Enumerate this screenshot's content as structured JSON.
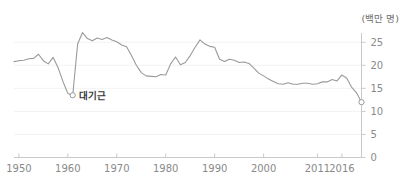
{
  "chart_data": {
    "type": "line",
    "title": "",
    "subtitle": "",
    "unit_label": "(백만 명)",
    "xlabel": "",
    "ylabel": "",
    "xlim": [
      1949,
      2020
    ],
    "ylim": [
      0,
      27
    ],
    "yticks": [
      0,
      5,
      10,
      15,
      20,
      25
    ],
    "ytick_labels": [
      "0",
      "5",
      "10",
      "15",
      "20",
      "25"
    ],
    "xticks": [
      1950,
      1960,
      1970,
      1980,
      1990,
      2011,
      2016
    ],
    "xtick_labels": [
      "1950",
      "1960",
      "1970",
      "1980",
      "1990",
      "2000",
      "2011",
      "2016"
    ],
    "xtick_values": [
      1950,
      1960,
      1970,
      1980,
      1990,
      2000,
      2011,
      2016
    ],
    "grid": true,
    "grid_axis": "y",
    "legend": "none",
    "line_color": "#9a9a9a",
    "axis_color": "#c9c9c9",
    "text_color": "#8a8a8a",
    "annotation_text_color": "#3a3a3a",
    "series": [
      {
        "name": "출생아 수",
        "x": [
          1949,
          1950,
          1951,
          1952,
          1953,
          1954,
          1955,
          1956,
          1957,
          1958,
          1959,
          1960,
          1961,
          1962,
          1963,
          1964,
          1965,
          1966,
          1967,
          1968,
          1969,
          1970,
          1971,
          1972,
          1973,
          1974,
          1975,
          1976,
          1977,
          1978,
          1979,
          1980,
          1981,
          1982,
          1983,
          1984,
          1985,
          1986,
          1987,
          1988,
          1989,
          1990,
          1991,
          1992,
          1993,
          1994,
          1995,
          1996,
          1997,
          1998,
          1999,
          2000,
          2001,
          2002,
          2003,
          2004,
          2005,
          2006,
          2007,
          2008,
          2009,
          2010,
          2011,
          2012,
          2013,
          2014,
          2015,
          2016,
          2017,
          2018,
          2019,
          2020
        ],
        "values": [
          20.8,
          21.0,
          21.1,
          21.4,
          21.5,
          22.4,
          21.0,
          20.3,
          21.7,
          19.5,
          16.5,
          13.9,
          13.5,
          24.6,
          27.1,
          25.8,
          25.3,
          25.9,
          25.6,
          26.0,
          25.5,
          25.1,
          24.4,
          24.0,
          22.1,
          20.0,
          18.4,
          17.7,
          17.6,
          17.5,
          18.0,
          17.9,
          20.3,
          21.8,
          20.1,
          20.6,
          22.1,
          23.9,
          25.5,
          24.6,
          24.1,
          23.9,
          21.3,
          20.8,
          21.3,
          21.1,
          20.6,
          20.7,
          20.4,
          19.4,
          18.3,
          17.7,
          17.0,
          16.5,
          16.0,
          15.9,
          16.2,
          15.9,
          15.9,
          16.1,
          16.1,
          15.9,
          16.0,
          16.4,
          16.4,
          16.9,
          16.6,
          17.9,
          17.2,
          15.2,
          14.0,
          12.0
        ]
      }
    ],
    "annotations": [
      {
        "name": "great-famine",
        "label": "대기근",
        "x": 1961,
        "y": 13.5,
        "marker": "open-circle"
      },
      {
        "name": "last-point",
        "label": "",
        "x": 2020,
        "y": 12.0,
        "marker": "open-circle"
      }
    ]
  }
}
